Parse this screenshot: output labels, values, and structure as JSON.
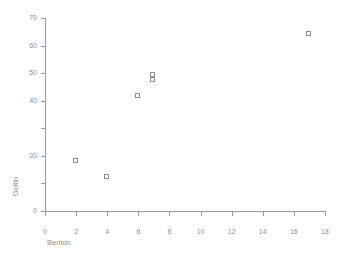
{
  "chart_data": {
    "type": "scatter",
    "title": "",
    "xlabel": "Benton",
    "ylabel": "Goltin",
    "xlim": [
      0,
      18
    ],
    "ylim": [
      0,
      70
    ],
    "grid": false,
    "legend": null,
    "marker": "open-square",
    "marker_color": "#8f8f8f",
    "xticks": [
      0,
      2,
      4,
      6,
      8,
      10,
      12,
      14,
      16,
      18
    ],
    "xticklabels": [
      "0",
      "2",
      "4",
      "6",
      "8",
      "10",
      "12",
      "14",
      "16",
      "18"
    ],
    "yticks": [
      0,
      10,
      20,
      30,
      40,
      50,
      60,
      70
    ],
    "yticklabels": [
      "0",
      "",
      "20",
      "",
      "40",
      "50",
      "60",
      "70"
    ],
    "points": [
      {
        "x": 2,
        "y": 18
      },
      {
        "x": 4,
        "y": 12
      },
      {
        "x": 6,
        "y": 41.5
      },
      {
        "x": 7,
        "y": 49
      },
      {
        "x": 7,
        "y": 47.5
      },
      {
        "x": 17,
        "y": 64
      }
    ]
  }
}
